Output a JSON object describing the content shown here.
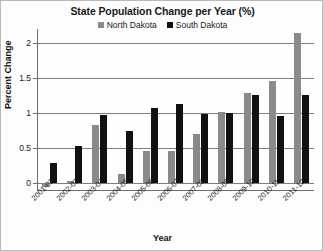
{
  "chart_data": {
    "type": "bar",
    "title": "State Population Change per Year (%)",
    "xlabel": "Year",
    "ylabel": "Percent Change",
    "ylim": [
      -0.12,
      2.2
    ],
    "yticks": [
      0,
      0.5,
      1,
      1.5,
      2
    ],
    "ytick_labels": [
      "0",
      "0.5",
      "1",
      "1.5",
      "2"
    ],
    "grid": true,
    "legend_position": "top-center",
    "categories": [
      "2001-02",
      "2002-03",
      "2003-04",
      "2004-05",
      "2005-06",
      "2006-07",
      "2007-08",
      "2008-09",
      "2009-10",
      "2010-11",
      "2011-12"
    ],
    "series": [
      {
        "name": "North Dakota",
        "color": "#8a8a8a",
        "values": [
          -0.07,
          0.02,
          0.82,
          0.13,
          0.45,
          0.46,
          0.7,
          1.01,
          1.29,
          1.45,
          2.15
        ]
      },
      {
        "name": "South Dakota",
        "color": "#111111",
        "values": [
          0.28,
          0.53,
          0.97,
          0.74,
          1.07,
          1.13,
          0.98,
          1.0,
          1.25,
          0.95,
          1.25
        ]
      }
    ]
  }
}
